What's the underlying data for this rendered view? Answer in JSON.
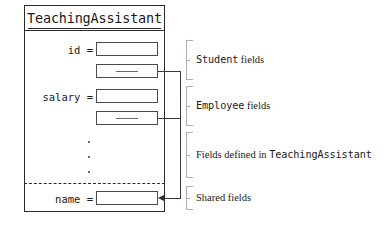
{
  "diagram": {
    "type": "object-memory-layout",
    "title": "TeachingAssistant",
    "fields": [
      {
        "label": "id =",
        "kind": "value-slot",
        "group": "Student"
      },
      {
        "label": "",
        "kind": "reference-slot",
        "group": "Student"
      },
      {
        "label": "salary =",
        "kind": "value-slot",
        "group": "Employee"
      },
      {
        "label": "",
        "kind": "reference-slot",
        "group": "Employee"
      },
      {
        "label": "name =",
        "kind": "value-slot",
        "group": "Shared"
      }
    ],
    "ellipsis": "...",
    "annotations": [
      {
        "name": "student-fields",
        "mono": "Student",
        "serif": "fields"
      },
      {
        "name": "employee-fields",
        "mono": "Employee",
        "serif": "fields"
      },
      {
        "name": "declared-fields",
        "serif_prefix": "Fields defined in",
        "mono": "TeachingAssistant"
      },
      {
        "name": "shared-fields",
        "serif": "Shared fields"
      }
    ],
    "colors": {
      "outline": "#2b2b2b",
      "slot_outline": "#4a4a4a",
      "brace": "#a9b0bd",
      "connector": "#3a3a3a",
      "text": "#1a1a1a",
      "background": "#ffffff"
    }
  }
}
